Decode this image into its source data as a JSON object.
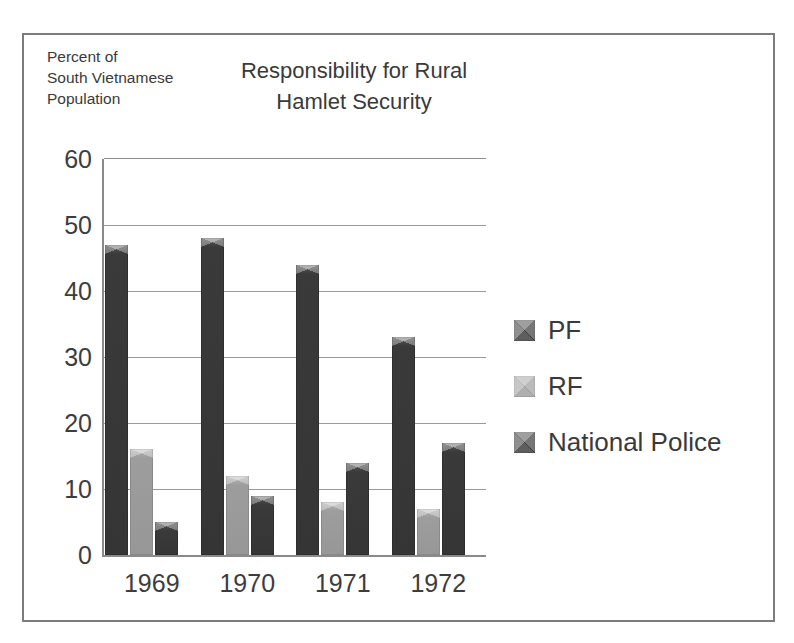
{
  "chart_data": {
    "type": "bar",
    "title": "Responsibility for Rural\nHamlet Security",
    "title_lines": [
      "Responsibility for Rural",
      "Hamlet Security"
    ],
    "xlabel": "",
    "ylabel": "Percent of\nSouth Vietnamese\nPopulation",
    "ylabel_lines": [
      "Percent of",
      "South Vietnamese",
      "Population"
    ],
    "categories": [
      "1969",
      "1970",
      "1971",
      "1972"
    ],
    "series": [
      {
        "name": "PF",
        "color": "#3b3b3b",
        "values": [
          47,
          48,
          44,
          33
        ]
      },
      {
        "name": "RF",
        "color": "#9d9d9d",
        "values": [
          16,
          12,
          8,
          7
        ]
      },
      {
        "name": "National Police",
        "color": "#3b3b3b",
        "values": [
          5,
          9,
          14,
          17
        ]
      }
    ],
    "ylim": [
      0,
      60
    ],
    "ytick_values": [
      0,
      10,
      20,
      30,
      40,
      50,
      60
    ],
    "ytick_labels": [
      "0",
      "10",
      "20",
      "30",
      "40",
      "50",
      "60"
    ],
    "grid": true,
    "grid_axis": "y",
    "legend_position": "right",
    "legend": [
      "PF",
      "RF",
      "National Police"
    ]
  },
  "figure": {
    "border_color": "#7c7c7c",
    "background": "#ffffff",
    "axis_color": "#8a8a8a",
    "gridline_color": "#9a9a9a",
    "text_color": "#3a3a3a"
  }
}
